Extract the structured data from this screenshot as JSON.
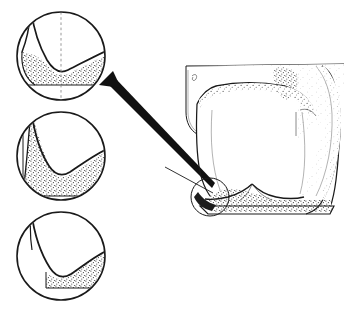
{
  "figure": {
    "kind": "anatomical-line-illustration",
    "background_color": "#ffffff",
    "ink_color": "#1a1a1a",
    "stipple_color": "#4a4a4a",
    "title": "",
    "caption": "",
    "has_text_labels": false
  },
  "detail_circles": [
    {
      "id": "detail-top",
      "order": 1,
      "center_x": 61,
      "center_y": 56,
      "radius": 44,
      "fill_level": "high",
      "fill_description": "stippled material filling groove to a flat level line near circle lower third",
      "has_centerline": true,
      "centerline_style": "dashed-vertical",
      "notch_shape": "v-groove",
      "is_arrow_target": true
    },
    {
      "id": "detail-middle",
      "order": 2,
      "center_x": 61,
      "center_y": 156,
      "radius": 44,
      "fill_level": "full",
      "fill_description": "stippled material filling broad wedge with flat base and deep v-notch carved from top",
      "has_centerline": false,
      "centerline_style": "none",
      "notch_shape": "v-groove",
      "is_arrow_target": false
    },
    {
      "id": "detail-bottom",
      "order": 3,
      "center_x": 61,
      "center_y": 256,
      "radius": 44,
      "fill_level": "low",
      "fill_description": "stippled material confined to lower-right quadrant with flat base",
      "has_centerline": false,
      "centerline_style": "none",
      "notch_shape": "v-groove",
      "is_arrow_target": false
    }
  ],
  "callout": {
    "circle": {
      "label": "region-of-interest",
      "center_x": 210,
      "center_y": 197,
      "radius": 19
    },
    "arrow": {
      "label": "magnification-arrow",
      "tip_x": 101,
      "tip_y": 86,
      "tail_x": 213,
      "tail_y": 186,
      "style": "solid-tapered-black",
      "head": "triangular"
    },
    "leader": {
      "label": "thin-leader-line",
      "from_x": 165,
      "from_y": 167,
      "to_x": 213,
      "to_y": 193
    }
  },
  "tooth": {
    "label": "molar-cross-section",
    "view": "buccolingual-section",
    "bounds": {
      "x": 180,
      "y": 60,
      "width": 168,
      "height": 163
    },
    "parts": [
      {
        "name": "enamel-crown",
        "shading": "light-stipple"
      },
      {
        "name": "occlusal-surface",
        "shading": "dark-stipple-patch"
      },
      {
        "name": "dentin-body",
        "shading": "none"
      },
      {
        "name": "cemento-enamel-junction",
        "shading": "stipple-band"
      },
      {
        "name": "root-base",
        "shading": "heavy-stipple"
      },
      {
        "name": "adjacent-tooth-contour",
        "shading": "light-stipple"
      }
    ]
  }
}
